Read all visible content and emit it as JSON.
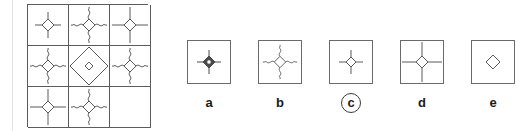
{
  "puzzle": {
    "type": "visual-analogy-matrix",
    "matrix": {
      "rows": 3,
      "cols": 3,
      "cells": [
        {
          "id": "r1c1",
          "figure": "diamond-with-straight-spokes",
          "spokes": "straight",
          "spoke_length": "medium",
          "diamond_fill": "none",
          "empty": false
        },
        {
          "id": "r1c2",
          "figure": "diamond-with-wavy-spokes",
          "spokes": "wavy",
          "spoke_length": "medium",
          "diamond_fill": "none",
          "empty": false
        },
        {
          "id": "r1c3",
          "figure": "diamond-with-straight-spokes",
          "spokes": "straight",
          "spoke_length": "long",
          "diamond_fill": "none",
          "empty": false
        },
        {
          "id": "r2c1",
          "figure": "diamond-with-wavy-spokes",
          "spokes": "wavy",
          "spoke_length": "medium",
          "diamond_fill": "none",
          "empty": false
        },
        {
          "id": "r2c2",
          "figure": "large-diamond-outline-with-small-diamond",
          "spokes": "none",
          "spoke_length": "none",
          "diamond_fill": "none",
          "empty": false
        },
        {
          "id": "r2c3",
          "figure": "diamond-with-wavy-spokes",
          "spokes": "wavy",
          "spoke_length": "medium",
          "diamond_fill": "none",
          "empty": false
        },
        {
          "id": "r3c1",
          "figure": "diamond-with-straight-spokes",
          "spokes": "straight",
          "spoke_length": "long",
          "diamond_fill": "none",
          "empty": false
        },
        {
          "id": "r3c2",
          "figure": "diamond-with-wavy-spokes",
          "spokes": "wavy",
          "spoke_length": "medium",
          "diamond_fill": "none",
          "empty": false
        },
        {
          "id": "r3c3",
          "figure": "blank-missing-piece",
          "spokes": "none",
          "spoke_length": "none",
          "diamond_fill": "none",
          "empty": true
        }
      ]
    },
    "options": [
      {
        "label": "a",
        "figure": "filled-diamond-with-short-straight-spokes",
        "spokes": "straight",
        "spoke_length": "short",
        "diamond_fill": "dark",
        "selected": false
      },
      {
        "label": "b",
        "figure": "diamond-with-wavy-spokes",
        "spokes": "wavy",
        "spoke_length": "medium",
        "diamond_fill": "none",
        "selected": false
      },
      {
        "label": "c",
        "figure": "diamond-with-short-straight-spokes",
        "spokes": "straight",
        "spoke_length": "short",
        "diamond_fill": "none",
        "selected": true
      },
      {
        "label": "d",
        "figure": "diamond-with-long-straight-spokes",
        "spokes": "straight",
        "spoke_length": "long",
        "diamond_fill": "none",
        "selected": false
      },
      {
        "label": "e",
        "figure": "plain-diamond-no-spokes",
        "spokes": "none",
        "spoke_length": "none",
        "diamond_fill": "none",
        "selected": false
      }
    ],
    "selected_answer": "c"
  },
  "colors": {
    "stroke": "#5b5b5b",
    "option_border": "#6a6a6a",
    "label_text": "#1a1a1a",
    "page_rule": "#e3e3e3",
    "background": "#ffffff"
  }
}
